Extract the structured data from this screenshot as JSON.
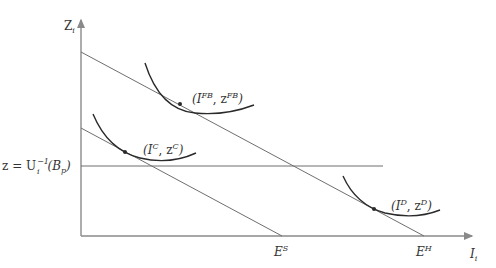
{
  "diagram": {
    "y_axis_label": {
      "main": "Z",
      "sub": "i"
    },
    "x_axis_label": {
      "main": "I",
      "sub": "i"
    },
    "z_line_label": {
      "prefix": "z = U",
      "sub": "i",
      "sup": "−1",
      "arg_open": "(B",
      "arg_sub": "p",
      "arg_close": ")"
    },
    "x_ticks": [
      {
        "main": "E",
        "sup": "S"
      },
      {
        "main": "E",
        "sup": "H"
      }
    ],
    "points": [
      {
        "id": "FB",
        "open": "(I",
        "sup1": "FB",
        "mid": ", z",
        "sup2": "FB",
        "close": ")"
      },
      {
        "id": "C",
        "open": "(I",
        "sup1": "C",
        "mid": ", z",
        "sup2": "C",
        "close": ")"
      },
      {
        "id": "D",
        "open": "(I",
        "sup1": "D",
        "mid": ", z",
        "sup2": "D",
        "close": ")"
      }
    ],
    "colors": {
      "axis": "#8a8a8a",
      "line": "#6e6e6e",
      "curve": "#2a2a2a",
      "text": "#333333"
    }
  }
}
